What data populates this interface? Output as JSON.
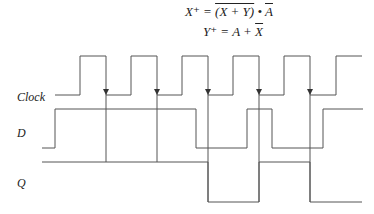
{
  "equations": {
    "x_lhs": "X⁺ =",
    "x_term1": "(X + Y)",
    "x_dot": " • ",
    "x_term2": "A",
    "y_lhs": "Y⁺ = A + ",
    "y_term": "X"
  },
  "signals": [
    {
      "name": "Clock",
      "label_y": 104
    },
    {
      "name": "D",
      "label_y": 140
    },
    {
      "name": "Q",
      "label_y": 190
    }
  ],
  "waveforms": {
    "clock": {
      "low": 95,
      "high": 56,
      "start": 55,
      "edges": [
        80,
        106,
        131,
        157,
        182,
        208,
        233,
        259,
        284,
        310,
        336
      ],
      "end": 362
    },
    "d": {
      "points": [
        [
          42,
          148
        ],
        [
          55,
          148
        ],
        [
          55,
          109
        ],
        [
          196,
          109
        ],
        [
          196,
          148
        ],
        [
          247,
          148
        ],
        [
          247,
          109
        ],
        [
          272,
          109
        ],
        [
          272,
          148
        ],
        [
          323,
          148
        ],
        [
          323,
          109
        ],
        [
          363,
          109
        ]
      ]
    },
    "q": {
      "points": [
        [
          42,
          162
        ],
        [
          208,
          162
        ],
        [
          208,
          202
        ],
        [
          259,
          202
        ],
        [
          259,
          162
        ],
        [
          310,
          162
        ],
        [
          310,
          202
        ],
        [
          362,
          202
        ]
      ]
    },
    "trigger_edges": [
      106,
      157,
      208,
      259,
      310
    ]
  },
  "colors": {
    "line": "#555555",
    "text": "#222222"
  }
}
